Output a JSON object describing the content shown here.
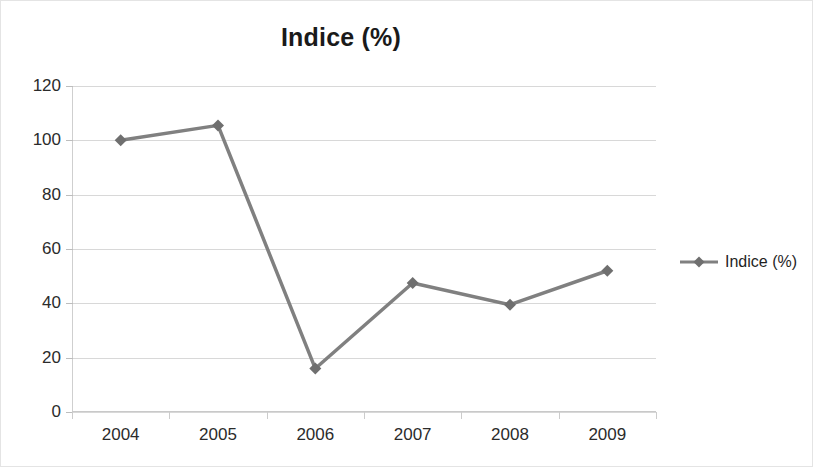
{
  "chart_data": {
    "type": "line",
    "title": "Indice (%)",
    "xlabel": "",
    "ylabel": "",
    "categories": [
      "2004",
      "2005",
      "2006",
      "2007",
      "2008",
      "2009"
    ],
    "series": [
      {
        "name": "Indice (%)",
        "values": [
          100,
          105.5,
          16,
          47.5,
          39.5,
          52
        ]
      }
    ],
    "ylim": [
      0,
      120
    ],
    "y_ticks": [
      0,
      20,
      40,
      60,
      80,
      100,
      120
    ],
    "y_tick_labels": [
      "0",
      "20",
      "40",
      "60",
      "80",
      "100",
      "120"
    ],
    "grid": true,
    "grid_axis": "y",
    "legend_position": "right",
    "marker": "diamond",
    "colors": {
      "series": "#808080",
      "gridline": "#d8d8d8",
      "axis": "#c9c9c9",
      "text": "#2b2b2b",
      "title": "#1a1a1a",
      "background": "#ffffff",
      "border": "#e4e4e4"
    }
  },
  "legend": {
    "entries": [
      {
        "label": "Indice (%)",
        "marker": "diamond-marker-icon"
      }
    ]
  }
}
